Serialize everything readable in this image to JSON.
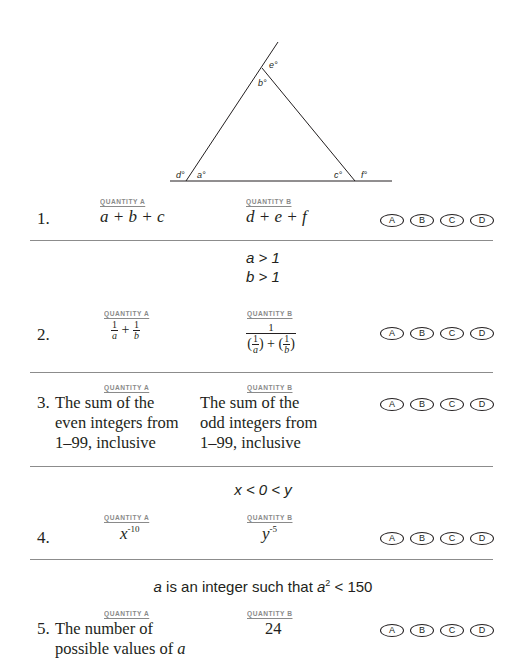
{
  "figure": {
    "type": "triangle-with-exterior-angles",
    "angle_labels": {
      "a": "a°",
      "b": "b°",
      "c": "c°",
      "d": "d°",
      "e": "e°",
      "f": "f°"
    }
  },
  "headers": {
    "quantity_a": "QUANTITY A",
    "quantity_b": "QUANTITY B"
  },
  "choices": [
    "A",
    "B",
    "C",
    "D"
  ],
  "questions": [
    {
      "number": "1.",
      "condition": null,
      "quantity_a": "a + b + c",
      "quantity_b": "d + e + f"
    },
    {
      "number": "2.",
      "condition": [
        "a > 1",
        "b > 1"
      ],
      "quantity_a": {
        "terms": [
          {
            "num": "1",
            "den": "a"
          },
          {
            "num": "1",
            "den": "b"
          }
        ],
        "op": "+"
      },
      "quantity_b": {
        "numerator": "1",
        "denominator_terms": [
          {
            "num": "1",
            "den": "a"
          },
          {
            "num": "1",
            "den": "b"
          }
        ],
        "op": "+"
      }
    },
    {
      "number": "3.",
      "condition": null,
      "quantity_a": "The sum of the even integers from 1–99, inclusive",
      "quantity_b": "The sum of the odd integers from 1–99, inclusive"
    },
    {
      "number": "4.",
      "condition": "x < 0 < y",
      "quantity_a": {
        "base": "x",
        "exp": "-10"
      },
      "quantity_b": {
        "base": "y",
        "exp": "-5"
      }
    },
    {
      "number": "5.",
      "condition": {
        "var": "a",
        "text_mid": " is an integer such that ",
        "var2": "a",
        "exp": "2",
        "text_end": " < 150"
      },
      "quantity_a_lines": [
        "The number of",
        "possible values of "
      ],
      "quantity_a_var": "a",
      "quantity_b": "24"
    }
  ]
}
